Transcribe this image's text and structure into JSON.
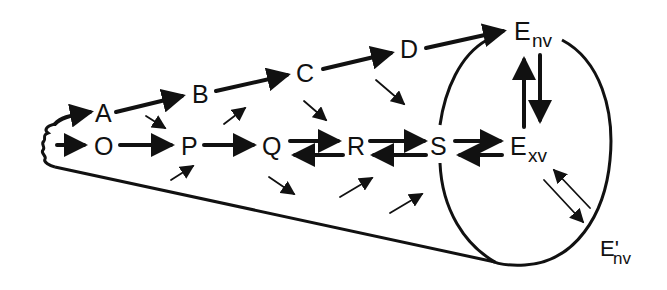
{
  "diagram": {
    "type": "reaction-scheme-cone",
    "colors": {
      "ink": "#111111",
      "background": "#ffffff"
    },
    "nodes": {
      "A": {
        "label": "A"
      },
      "B": {
        "label": "B"
      },
      "C": {
        "label": "C"
      },
      "D": {
        "label": "D"
      },
      "O": {
        "label": "O"
      },
      "P": {
        "label": "P"
      },
      "Q": {
        "label": "Q"
      },
      "R": {
        "label": "R"
      },
      "S": {
        "label": "S"
      },
      "E_nv": {
        "label": "E",
        "subscript": "nv"
      },
      "E_xv": {
        "label": "E",
        "subscript": "xv"
      },
      "E_prime_nv": {
        "label": "E'",
        "subscript": "nv"
      }
    },
    "edges": [
      {
        "from": "origin",
        "to": "A",
        "style": "thick"
      },
      {
        "from": "origin",
        "to": "O",
        "style": "thick"
      },
      {
        "from": "A",
        "to": "B",
        "style": "thick"
      },
      {
        "from": "B",
        "to": "C",
        "style": "thick"
      },
      {
        "from": "C",
        "to": "D",
        "style": "thick"
      },
      {
        "from": "D",
        "to": "E_nv",
        "style": "thick"
      },
      {
        "from": "O",
        "to": "P",
        "style": "thick"
      },
      {
        "from": "P",
        "to": "Q",
        "style": "thick"
      },
      {
        "from": "Q",
        "to": "R",
        "style": "thick",
        "reversible": true
      },
      {
        "from": "R",
        "to": "S",
        "style": "thick",
        "reversible": true
      },
      {
        "from": "S",
        "to": "E_xv",
        "style": "thick",
        "reversible": true
      },
      {
        "from": "E_xv",
        "to": "E_nv",
        "style": "thick",
        "reversible": true
      },
      {
        "from": "E_xv",
        "to": "E_prime_nv",
        "style": "thin",
        "reversible": true
      }
    ],
    "cross_arrows": [
      {
        "from": "A",
        "to": "P",
        "direction": "down-right"
      },
      {
        "from": "P",
        "to": "B",
        "direction": "up-right"
      },
      {
        "from": "C",
        "to": "R",
        "direction": "down-right"
      },
      {
        "from": "D",
        "to": "S",
        "direction": "down-right"
      },
      {
        "from": "below",
        "to": "P",
        "direction": "up-right"
      },
      {
        "from": "Q",
        "to": "below",
        "direction": "down-right"
      },
      {
        "from": "below",
        "to": "R",
        "direction": "up-right"
      },
      {
        "from": "below",
        "to": "S",
        "direction": "up-right"
      }
    ],
    "shape": "cone-with-elliptical-base"
  }
}
